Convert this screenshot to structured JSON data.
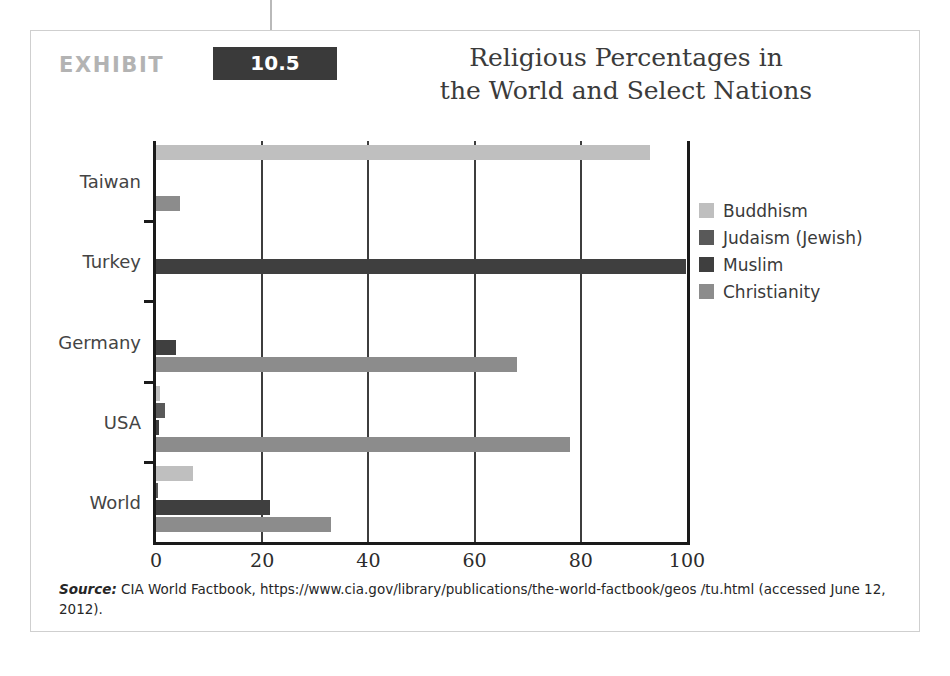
{
  "exhibit": {
    "word": "EXHIBIT",
    "number": "10.5",
    "title_line1": "Religious Percentages in",
    "title_line2": "the World and Select Nations",
    "badge_color": "#3a3a3a",
    "word_color": "#b3b3b3"
  },
  "source": {
    "label": "Source:",
    "text": " CIA World Factbook, https://www.cia.gov/library/publications/the-world-factbook/geos /tu.html (accessed June 12, 2012)."
  },
  "legend": {
    "position": "right",
    "items": [
      {
        "label": "Buddhism",
        "color": "#bfbfbf"
      },
      {
        "label": "Judaism (Jewish)",
        "color": "#595959"
      },
      {
        "label": "Muslim",
        "color": "#3f3f3f"
      },
      {
        "label": "Christianity",
        "color": "#8c8c8c"
      }
    ]
  },
  "chart_data": {
    "type": "bar",
    "orientation": "horizontal",
    "title": "Religious Percentages in the World and Select Nations",
    "xlabel": "",
    "ylabel": "",
    "xlim": [
      0,
      100
    ],
    "xticks": [
      "0",
      "20",
      "40",
      "60",
      "80",
      "100"
    ],
    "grid": true,
    "categories": [
      "World",
      "USA",
      "Germany",
      "Turkey",
      "Taiwan"
    ],
    "categories_top_to_bottom": [
      "Taiwan",
      "Turkey",
      "Germany",
      "USA",
      "World"
    ],
    "series": [
      {
        "name": "Buddhism",
        "color": "#bfbfbf",
        "values": [
          7.0,
          0.7,
          0.0,
          0.0,
          93.0
        ]
      },
      {
        "name": "Judaism (Jewish)",
        "color": "#595959",
        "values": [
          0.2,
          1.7,
          0.0,
          0.0,
          0.0
        ]
      },
      {
        "name": "Muslim",
        "color": "#3f3f3f",
        "values": [
          21.5,
          0.6,
          3.7,
          99.8,
          0.0
        ]
      },
      {
        "name": "Christianity",
        "color": "#8c8c8c",
        "values": [
          33.0,
          78.0,
          68.0,
          0.0,
          4.5
        ]
      }
    ]
  }
}
